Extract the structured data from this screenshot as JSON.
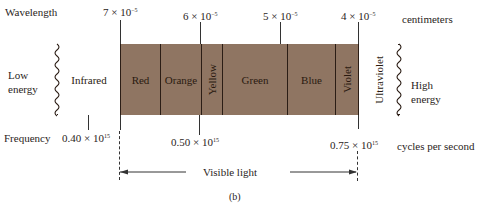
{
  "diagram": {
    "type": "electromagnetic-spectrum-visible",
    "caption": "(b)",
    "row_labels": {
      "wavelength": "Wavelength",
      "frequency": "Frequency",
      "low_energy_line1": "Low",
      "low_energy_line2": "energy",
      "high_energy_line1": "High",
      "high_energy_line2": "energy"
    },
    "units": {
      "wavelength": "centimeters",
      "frequency": "cycles per second"
    },
    "wavelength_ticks": [
      {
        "mantissa": "7",
        "exponent": "−5",
        "text": "7 × 10⁻⁵"
      },
      {
        "mantissa": "6",
        "exponent": "−5",
        "text": "6 × 10⁻⁵"
      },
      {
        "mantissa": "5",
        "exponent": "−5",
        "text": "5 × 10⁻⁵"
      },
      {
        "mantissa": "4",
        "exponent": "−5",
        "text": "4 × 10⁻⁵"
      }
    ],
    "frequency_ticks": [
      {
        "mantissa": "0.40",
        "exponent": "15",
        "text": "0.40 × 10¹⁵"
      },
      {
        "mantissa": "0.50",
        "exponent": "15",
        "text": "0.50 × 10¹⁵"
      },
      {
        "mantissa": "0.75",
        "exponent": "15",
        "text": "0.75 × 10¹⁵"
      }
    ],
    "bands": [
      {
        "label": "Infrared",
        "shaded": false,
        "vertical": false
      },
      {
        "label": "Red",
        "shaded": true,
        "vertical": false
      },
      {
        "label": "Orange",
        "shaded": true,
        "vertical": false
      },
      {
        "label": "Yellow",
        "shaded": true,
        "vertical": true
      },
      {
        "label": "Green",
        "shaded": true,
        "vertical": false
      },
      {
        "label": "Blue",
        "shaded": true,
        "vertical": false
      },
      {
        "label": "Violet",
        "shaded": true,
        "vertical": true
      },
      {
        "label": "Ultraviolet",
        "shaded": false,
        "vertical": true
      }
    ],
    "visible_range_label": "Visible light",
    "times_symbol": "×",
    "ten": "10",
    "colors": {
      "visible_fill": "#8f7562",
      "outline": "#2b1d15",
      "text": "#2a2422"
    }
  }
}
